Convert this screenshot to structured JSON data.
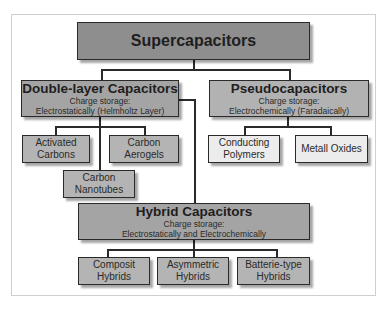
{
  "diagram": {
    "root": {
      "label": "Supercapacitors"
    },
    "double_layer": {
      "label": "Double-layer Capacitors",
      "storage_label": "Charge storage:",
      "storage_mode": "Electrostatically (Helmholtz  Layer)",
      "children": [
        {
          "label_line1": "Activated",
          "label_line2": "Carbons"
        },
        {
          "label_line1": "Carbon",
          "label_line2": "Aerogels"
        },
        {
          "label_line1": "Carbon",
          "label_line2": "Nanotubes"
        }
      ]
    },
    "pseudo": {
      "label": "Pseudocapacitors",
      "storage_label": "Charge storage:",
      "storage_mode": "Electrochemically  (Faradaically)",
      "children": [
        {
          "label_line1": "Conducting",
          "label_line2": "Polymers"
        },
        {
          "label_line1": "Metall Oxides",
          "label_line2": ""
        }
      ]
    },
    "hybrid": {
      "label": "Hybrid Capacitors",
      "storage_label": "Charge storage:",
      "storage_mode": "Electrostatically and Electrochemically",
      "children": [
        {
          "label_line1": "Composit",
          "label_line2": "Hybrids"
        },
        {
          "label_line1": "Asymmetric",
          "label_line2": "Hybrids"
        },
        {
          "label_line1": "Batterie-type",
          "label_line2": "Hybrids"
        }
      ]
    },
    "colors": {
      "root_fill": "#8e8e8e",
      "category_fill": "#b2b2b2",
      "leaf_dark_fill": "#b4b4b4",
      "leaf_light_fill": "#ececec",
      "stroke": "#2a2a2a"
    }
  }
}
